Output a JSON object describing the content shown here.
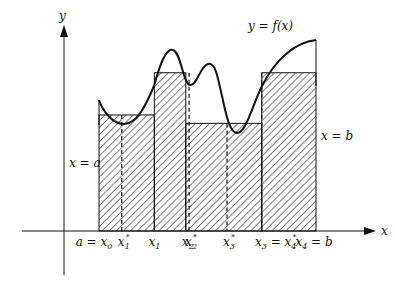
{
  "diagram": {
    "curve_label": "y = f(x)",
    "axis_x_label": "x",
    "axis_y_label": "y",
    "left_bound_label": "x = a",
    "right_bound_label": "x = b",
    "colors": {
      "ink": "#111111",
      "background": "#ffffff"
    },
    "partition_points": [
      {
        "id": "x0",
        "label_main": "a = x",
        "label_sub": "0",
        "pos": 0.0
      },
      {
        "id": "x1",
        "label_main": "x",
        "label_sub": "1",
        "pos": 0.255
      },
      {
        "id": "x2",
        "label_main": "x",
        "label_sub": "2",
        "pos": 0.4
      },
      {
        "id": "x3",
        "label_main": "x",
        "label_sub": "3",
        "label_suffix": " = x",
        "label_suffix_sub": "4",
        "label_suffix_star": true,
        "pos": 0.75
      },
      {
        "id": "x4",
        "label_main": "x",
        "label_sub": "4",
        "label_suffix_plain": " = b",
        "pos": 1.0
      }
    ],
    "sample_points": [
      {
        "id": "x1s",
        "label_main": "x",
        "label_sub": "1",
        "pos": 0.105
      },
      {
        "id": "x2s",
        "label_main": "x",
        "label_sub": "2",
        "pos": 0.415
      },
      {
        "id": "x3s",
        "label_main": "x",
        "label_sub": "3",
        "pos": 0.59
      }
    ],
    "rectangle_heights": [
      0.55,
      0.75,
      0.51,
      0.75
    ]
  }
}
